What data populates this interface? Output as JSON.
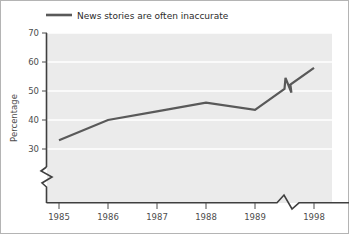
{
  "chart_data": {
    "type": "line",
    "title": "",
    "subtitle": "",
    "xlabel": "",
    "ylabel": "Percentage",
    "x": [
      1985,
      1986,
      1987,
      1988,
      1989,
      1998
    ],
    "xtick_labels": [
      "1985",
      "1986",
      "1987",
      "1988",
      "1989",
      "1998"
    ],
    "ytick_labels": [
      "30",
      "40",
      "50",
      "60",
      "70"
    ],
    "ytick_values": [
      30,
      40,
      50,
      60,
      70
    ],
    "ylim": [
      26,
      70
    ],
    "grid": "horizontal-white",
    "legend_position": "top-left",
    "axis_break_x": true,
    "axis_break_y": true,
    "series": [
      {
        "name": "News stories are often inaccurate",
        "color": "#595959",
        "values": [
          33,
          40,
          43,
          46,
          43.5,
          58
        ]
      }
    ]
  },
  "legend": {
    "entries": [
      {
        "label": "News stories are often inaccurate",
        "color": "#595959"
      }
    ]
  },
  "axes": {
    "y_title": "Percentage",
    "y_ticks": [
      "70",
      "60",
      "50",
      "40",
      "30"
    ],
    "x_ticks": [
      "1985",
      "1986",
      "1987",
      "1988",
      "1989",
      "1998"
    ]
  },
  "colors": {
    "plot_background": "#ebebeb",
    "gridline": "#ffffff",
    "axis": "#3f3f3f",
    "series_line": "#595959",
    "text": "#4d4d4d",
    "figure_border": "#b4b4b4"
  }
}
